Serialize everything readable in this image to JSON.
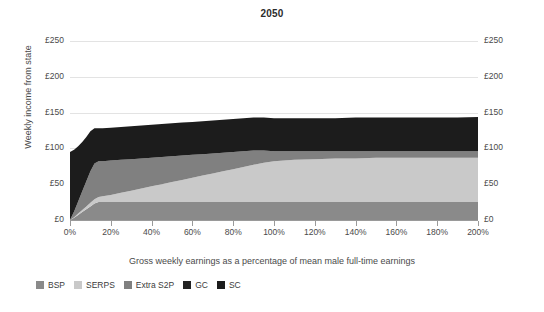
{
  "chart_data": {
    "type": "area",
    "stacked": true,
    "title": "2050",
    "xlabel": "Gross weekly earnings as a percentage of mean male full-time earnings",
    "ylabel": "Weekly income from state",
    "xlim": [
      0,
      200
    ],
    "ylim": [
      0,
      250
    ],
    "grid": true,
    "legend_position": "bottom-left",
    "xticks": [
      "0%",
      "20%",
      "40%",
      "60%",
      "80%",
      "100%",
      "120%",
      "140%",
      "160%",
      "180%",
      "200%"
    ],
    "xtick_values": [
      0,
      20,
      40,
      60,
      80,
      100,
      120,
      140,
      160,
      180,
      200
    ],
    "yticks_left": [
      "£0",
      "£50",
      "£100",
      "£150",
      "£200",
      "£250"
    ],
    "yticks_right": [
      "£0",
      "£50",
      "£100",
      "£150",
      "£200",
      "£250"
    ],
    "ytick_values": [
      0,
      50,
      100,
      150,
      200,
      250
    ],
    "x": [
      0,
      2,
      4,
      6,
      8,
      10,
      12,
      14,
      16,
      20,
      25,
      30,
      35,
      40,
      45,
      50,
      55,
      60,
      65,
      70,
      75,
      80,
      85,
      90,
      95,
      100,
      110,
      120,
      130,
      140,
      150,
      160,
      170,
      180,
      190,
      200
    ],
    "series": [
      {
        "name": "BSP",
        "color": "#8a8a8a",
        "values": [
          0,
          3,
          7,
          11,
          15,
          19,
          23,
          25,
          25,
          25,
          25,
          25,
          25,
          25,
          25,
          25,
          25,
          25,
          25,
          25,
          25,
          25,
          25,
          25,
          25,
          25,
          25,
          25,
          25,
          25,
          25,
          25,
          25,
          25,
          25,
          25
        ]
      },
      {
        "name": "SERPS",
        "color": "#c9c9c9",
        "values": [
          0,
          1,
          2,
          3,
          4,
          5,
          6,
          7,
          8,
          10,
          13,
          16,
          19,
          22,
          25,
          28,
          31,
          34,
          37,
          40,
          43,
          46,
          49,
          52,
          55,
          57,
          59,
          60,
          61,
          61,
          62,
          62,
          62,
          62,
          62,
          62
        ]
      },
      {
        "name": "Extra S2P",
        "color": "#808080",
        "values": [
          0,
          8,
          17,
          26,
          35,
          44,
          50,
          50,
          49,
          48,
          46,
          44,
          42,
          40,
          38,
          36,
          34,
          32,
          30,
          28,
          26,
          24,
          22,
          20,
          17,
          14,
          12,
          11,
          10,
          10,
          9,
          9,
          9,
          9,
          9,
          9
        ]
      },
      {
        "name": "GC",
        "color": "#232323",
        "values": [
          0,
          0,
          0,
          0,
          0,
          0,
          0,
          0,
          0,
          0,
          0,
          0,
          0,
          0,
          0,
          0,
          0,
          0,
          0,
          0,
          0,
          0,
          0,
          0,
          0,
          0,
          0,
          0,
          0,
          0,
          0,
          0,
          0,
          0,
          0,
          0
        ]
      },
      {
        "name": "SC",
        "color": "#1c1c1c",
        "values": [
          95,
          86,
          77,
          69,
          62,
          56,
          49,
          46,
          46,
          46,
          46,
          46,
          46,
          46,
          46,
          46,
          46,
          46,
          46,
          46,
          46,
          46,
          46,
          46,
          46,
          46,
          46,
          46,
          46,
          47,
          47,
          47,
          47,
          47,
          47,
          48
        ]
      }
    ],
    "legend": [
      {
        "label": "BSP",
        "color": "#8a8a8a"
      },
      {
        "label": "SERPS",
        "color": "#c9c9c9"
      },
      {
        "label": "Extra S2P",
        "color": "#808080"
      },
      {
        "label": "GC",
        "color": "#232323"
      },
      {
        "label": "SC",
        "color": "#1c1c1c"
      }
    ]
  }
}
